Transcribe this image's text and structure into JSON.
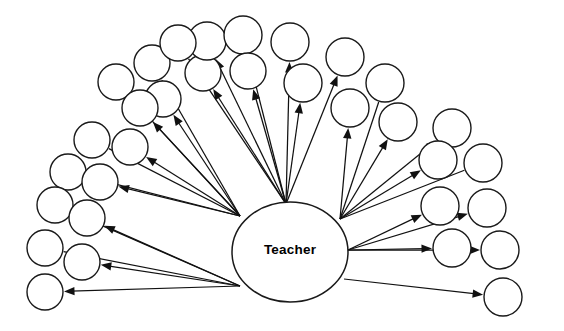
{
  "diagram": {
    "type": "radial-node-link",
    "title": "Teacher",
    "hub": {
      "label": "Teacher",
      "shape": "ellipse",
      "cx": 290,
      "cy": 252,
      "rx": 58,
      "ry": 50,
      "fill": "#ffffff",
      "stroke": "#1a1a1a",
      "label_x": 290,
      "label_y": 250
    },
    "style": {
      "background": "#ffffff",
      "node_fill": "#ffffff",
      "node_stroke": "#1a1a1a",
      "node_radius": 18,
      "edge_color": "#111111",
      "arrowhead": "filled-triangle"
    },
    "counts": {
      "nodes": 32,
      "edges": 32,
      "hubs": 1
    },
    "origins": [
      {
        "id": "o-top",
        "x": 286,
        "y": 204
      },
      {
        "id": "o-upper-left",
        "x": 240,
        "y": 216
      },
      {
        "id": "o-lower-left",
        "x": 240,
        "y": 286
      },
      {
        "id": "o-upper-right",
        "x": 340,
        "y": 219
      },
      {
        "id": "o-right",
        "x": 348,
        "y": 250
      },
      {
        "id": "o-lower-right",
        "x": 344,
        "y": 279
      }
    ],
    "nodes": [
      {
        "id": "n01",
        "cx": 116,
        "cy": 82,
        "r": 18,
        "origin": "o-upper-left",
        "arrow": false
      },
      {
        "id": "n02",
        "cx": 152,
        "cy": 63,
        "r": 18,
        "origin": "o-upper-left",
        "arrow": true
      },
      {
        "id": "n03",
        "cx": 163,
        "cy": 99,
        "r": 18,
        "origin": "o-upper-left",
        "arrow": true
      },
      {
        "id": "n04",
        "cx": 203,
        "cy": 73,
        "r": 18,
        "origin": "o-top",
        "arrow": true
      },
      {
        "id": "n05",
        "cx": 207,
        "cy": 41,
        "r": 19,
        "origin": "o-top",
        "arrow": true
      },
      {
        "id": "n06",
        "cx": 243,
        "cy": 35,
        "r": 19,
        "origin": "o-top",
        "arrow": true
      },
      {
        "id": "n07",
        "cx": 248,
        "cy": 71,
        "r": 18,
        "origin": "o-top",
        "arrow": true
      },
      {
        "id": "n08",
        "cx": 290,
        "cy": 42,
        "r": 19,
        "origin": "o-top",
        "arrow": true
      },
      {
        "id": "n09",
        "cx": 303,
        "cy": 83,
        "r": 19,
        "origin": "o-top",
        "arrow": true
      },
      {
        "id": "n10",
        "cx": 345,
        "cy": 57,
        "r": 19,
        "origin": "o-top",
        "arrow": true
      },
      {
        "id": "n11",
        "cx": 350,
        "cy": 108,
        "r": 19,
        "origin": "o-upper-right",
        "arrow": true
      },
      {
        "id": "n12",
        "cx": 385,
        "cy": 83,
        "r": 19,
        "origin": "o-upper-right",
        "arrow": false
      },
      {
        "id": "n13",
        "cx": 398,
        "cy": 122,
        "r": 19,
        "origin": "o-upper-right",
        "arrow": true
      },
      {
        "id": "n14",
        "cx": 452,
        "cy": 128,
        "r": 19,
        "origin": "o-upper-right",
        "arrow": true
      },
      {
        "id": "n15",
        "cx": 438,
        "cy": 160,
        "r": 19,
        "origin": "o-upper-right",
        "arrow": true
      },
      {
        "id": "n16",
        "cx": 483,
        "cy": 163,
        "r": 19,
        "origin": "o-upper-right",
        "arrow": false
      },
      {
        "id": "n17",
        "cx": 440,
        "cy": 206,
        "r": 19,
        "origin": "o-right",
        "arrow": true
      },
      {
        "id": "n18",
        "cx": 487,
        "cy": 208,
        "r": 19,
        "origin": "o-right",
        "arrow": true
      },
      {
        "id": "n19",
        "cx": 452,
        "cy": 248,
        "r": 19,
        "origin": "o-right",
        "arrow": true
      },
      {
        "id": "n20",
        "cx": 500,
        "cy": 250,
        "r": 19,
        "origin": "o-right",
        "arrow": true
      },
      {
        "id": "n21",
        "cx": 503,
        "cy": 297,
        "r": 19,
        "origin": "o-lower-right",
        "arrow": true
      },
      {
        "id": "n22",
        "cx": 92,
        "cy": 140,
        "r": 18,
        "origin": "o-upper-left",
        "arrow": false
      },
      {
        "id": "n23",
        "cx": 130,
        "cy": 147,
        "r": 18,
        "origin": "o-upper-left",
        "arrow": true
      },
      {
        "id": "n24",
        "cx": 68,
        "cy": 172,
        "r": 18,
        "origin": "o-upper-left",
        "arrow": false
      },
      {
        "id": "n25",
        "cx": 100,
        "cy": 182,
        "r": 18,
        "origin": "o-upper-left",
        "arrow": true
      },
      {
        "id": "n26",
        "cx": 55,
        "cy": 205,
        "r": 18,
        "origin": "o-lower-left",
        "arrow": false
      },
      {
        "id": "n27",
        "cx": 87,
        "cy": 218,
        "r": 18,
        "origin": "o-lower-left",
        "arrow": true
      },
      {
        "id": "n28",
        "cx": 45,
        "cy": 248,
        "r": 18,
        "origin": "o-lower-left",
        "arrow": false
      },
      {
        "id": "n29",
        "cx": 82,
        "cy": 262,
        "r": 18,
        "origin": "o-lower-left",
        "arrow": true
      },
      {
        "id": "n30",
        "cx": 45,
        "cy": 292,
        "r": 18,
        "origin": "o-lower-left",
        "arrow": true
      },
      {
        "id": "n31",
        "cx": 140,
        "cy": 108,
        "r": 18,
        "origin": "o-upper-left",
        "arrow": true
      },
      {
        "id": "n32",
        "cx": 178,
        "cy": 43,
        "r": 18,
        "origin": "o-top",
        "arrow": false
      }
    ]
  }
}
